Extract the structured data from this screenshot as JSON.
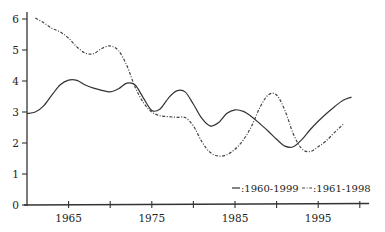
{
  "chart_data": {
    "type": "line",
    "title": "",
    "xlabel": "",
    "ylabel": "",
    "xlim": [
      1960,
      2001
    ],
    "ylim": [
      0,
      6.3
    ],
    "grid": false,
    "x_ticks": [
      1960,
      1965,
      1970,
      1975,
      1980,
      1985,
      1990,
      1995,
      2000
    ],
    "x_tick_labels": [
      {
        "value": 1965,
        "label": "1965"
      },
      {
        "value": 1975,
        "label": "1975"
      },
      {
        "value": 1985,
        "label": "1985"
      },
      {
        "value": 1995,
        "label": "1995"
      }
    ],
    "y_ticks": [
      {
        "value": 0,
        "label": "0"
      },
      {
        "value": 1,
        "label": "1"
      },
      {
        "value": 2,
        "label": "2"
      },
      {
        "value": 3,
        "label": "3"
      },
      {
        "value": 4,
        "label": "4"
      },
      {
        "value": 5,
        "label": "5"
      },
      {
        "value": 6,
        "label": "6"
      }
    ],
    "legend_position": "bottom-right",
    "series": [
      {
        "name": ":1960-1999",
        "style": "solid",
        "x": [
          1960,
          1961,
          1962,
          1963,
          1964,
          1965,
          1966,
          1967,
          1968,
          1969,
          1970,
          1971,
          1972,
          1973,
          1974,
          1975,
          1976,
          1977,
          1978,
          1979,
          1980,
          1981,
          1982,
          1983,
          1984,
          1985,
          1986,
          1987,
          1988,
          1989,
          1990,
          1991,
          1992,
          1993,
          1994,
          1995,
          1996,
          1997,
          1998,
          1999
        ],
        "values": [
          2.95,
          3.0,
          3.2,
          3.55,
          3.88,
          4.03,
          4.02,
          3.87,
          3.77,
          3.7,
          3.65,
          3.75,
          3.93,
          3.87,
          3.45,
          3.05,
          3.1,
          3.45,
          3.68,
          3.65,
          3.25,
          2.8,
          2.55,
          2.65,
          2.95,
          3.07,
          3.02,
          2.85,
          2.62,
          2.38,
          2.12,
          1.9,
          1.88,
          2.1,
          2.42,
          2.7,
          2.95,
          3.18,
          3.38,
          3.48
        ]
      },
      {
        "name": ":1961-1998",
        "style": "dash-dot",
        "x": [
          1961,
          1962,
          1963,
          1964,
          1965,
          1966,
          1967,
          1968,
          1969,
          1970,
          1971,
          1972,
          1973,
          1974,
          1975,
          1976,
          1977,
          1978,
          1979,
          1980,
          1981,
          1982,
          1983,
          1984,
          1985,
          1986,
          1987,
          1988,
          1989,
          1990,
          1991,
          1992,
          1993,
          1994,
          1995,
          1996,
          1997,
          1998
        ],
        "values": [
          6.03,
          5.88,
          5.7,
          5.58,
          5.38,
          5.1,
          4.9,
          4.88,
          5.05,
          5.13,
          4.98,
          4.5,
          3.8,
          3.3,
          3.0,
          2.88,
          2.85,
          2.83,
          2.82,
          2.55,
          2.05,
          1.7,
          1.58,
          1.62,
          1.8,
          2.1,
          2.55,
          3.15,
          3.55,
          3.55,
          3.05,
          2.3,
          1.82,
          1.72,
          1.88,
          2.08,
          2.35,
          2.6
        ]
      }
    ]
  }
}
